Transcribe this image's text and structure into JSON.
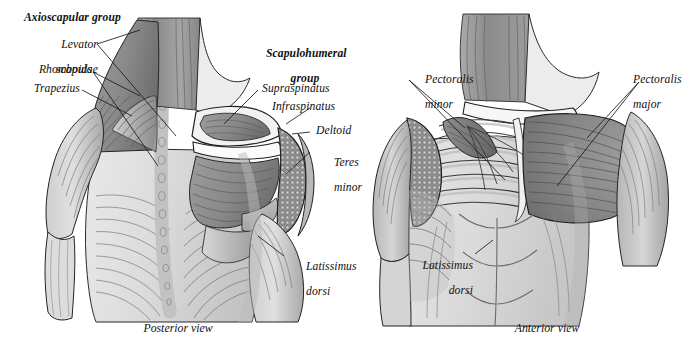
{
  "plate": {
    "title": "Shoulder musculature: posterior and anterior views",
    "background": "#ffffff",
    "ink": "#101010"
  },
  "panels": [
    {
      "id": "posterior",
      "caption": "Posterior view",
      "group_headings": [
        {
          "name": "axioscapular-group",
          "text": "Axioscapular group"
        },
        {
          "name": "scapulohumeral-group",
          "line1": "Scapulohumeral",
          "line2": "group"
        }
      ],
      "labels": [
        {
          "name": "levator-scapulae",
          "line1": "Levator",
          "line2": "scapulae"
        },
        {
          "name": "rhomboids",
          "line1": "Rhomboids",
          "line2": ""
        },
        {
          "name": "trapezius",
          "line1": "Trapezius",
          "line2": ""
        },
        {
          "name": "supraspinatus",
          "line1": "Supraspinatus",
          "line2": ""
        },
        {
          "name": "infraspinatus",
          "line1": "Infraspinatus",
          "line2": ""
        },
        {
          "name": "deltoid",
          "line1": "Deltoid",
          "line2": ""
        },
        {
          "name": "teres-minor",
          "line1": "Teres",
          "line2": "minor"
        },
        {
          "name": "latissimus-dorsi-posterior",
          "line1": "Latissimus",
          "line2": "dorsi"
        }
      ]
    },
    {
      "id": "anterior",
      "caption": "Anterior view",
      "group_headings": [],
      "labels": [
        {
          "name": "pectoralis-minor",
          "line1": "Pectoralis",
          "line2": "minor"
        },
        {
          "name": "pectoralis-major",
          "line1": "Pectoralis",
          "line2": "major"
        },
        {
          "name": "latissimus-dorsi-anterior",
          "line1": "Latissimus",
          "line2": "dorsi"
        }
      ]
    }
  ],
  "palette": {
    "muscle_dark": "#7b7b7b",
    "muscle_mid": "#9a9a9a",
    "muscle_light": "#bdbdbd",
    "skin_pale": "#e3e3e3",
    "bone_white": "#f3f3f3",
    "outline": "#1a1a1a",
    "leader_line": "#1a1a1a"
  }
}
